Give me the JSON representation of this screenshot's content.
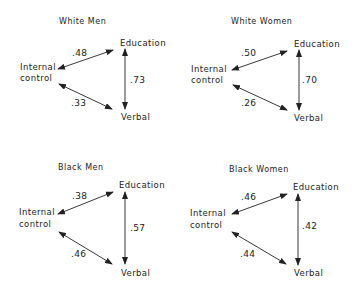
{
  "nodes": {
    "education": "Education",
    "verbal": "Verbal",
    "internal_line1": "Internal",
    "internal_line2": "control"
  },
  "panels": [
    {
      "title": "White Men",
      "ic_education": ".48",
      "ic_verbal": ".33",
      "education_verbal": ".73"
    },
    {
      "title": "White Women",
      "ic_education": ".50",
      "ic_verbal": ".26",
      "education_verbal": ".70"
    },
    {
      "title": "Black Men",
      "ic_education": ".38",
      "ic_verbal": ".46",
      "education_verbal": ".57"
    },
    {
      "title": "Black Women",
      "ic_education": ".46",
      "ic_verbal": ".44",
      "education_verbal": ".42"
    }
  ]
}
